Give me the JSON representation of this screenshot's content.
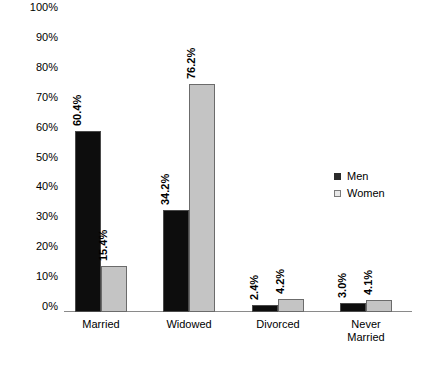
{
  "chart_data": {
    "type": "bar",
    "title": "",
    "subtitle": "",
    "xlabel": "",
    "ylabel": "",
    "ylim": [
      0,
      100
    ],
    "grid": false,
    "legend_position": "right",
    "categories": [
      "Married",
      "Widowed",
      "Divorced",
      "Never\nMarried"
    ],
    "category_lines": [
      [
        "Married"
      ],
      [
        "Widowed"
      ],
      [
        "Divorced"
      ],
      [
        "Never",
        "Married"
      ]
    ],
    "series": [
      {
        "name": "Men",
        "color": "#0d0d0d",
        "values": [
          60.4,
          34.2,
          2.4,
          3.0
        ],
        "labels": [
          "60.4%",
          "34.2%",
          "2.4%",
          "3.0%"
        ]
      },
      {
        "name": "Women",
        "color": "#c4c4c4",
        "values": [
          15.4,
          76.2,
          4.2,
          4.1
        ],
        "labels": [
          "15.4%",
          "76.2%",
          "4.2%",
          "4.1%"
        ]
      }
    ],
    "y_ticks": [
      "100%",
      "90%",
      "80%",
      "70%",
      "60%",
      "50%",
      "40%",
      "30%",
      "20%",
      "10%",
      "0%"
    ],
    "y_tick_values": [
      100,
      90,
      80,
      70,
      60,
      50,
      40,
      30,
      20,
      10,
      0
    ]
  },
  "legend": {
    "items": [
      {
        "label": "Men",
        "swatch": "men-swatch"
      },
      {
        "label": "Women",
        "swatch": "women-swatch"
      }
    ]
  }
}
